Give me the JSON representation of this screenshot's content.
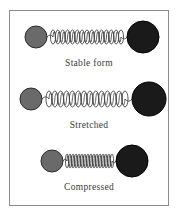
{
  "figure": {
    "background_color": "#ffffff",
    "border_color": "#8c8c8c",
    "caption_color": "#3a3a3a",
    "small_ball_color": "#6a6a6a",
    "small_ball_outline": "#2b2b2b",
    "large_ball_color": "#1a1a1a",
    "large_ball_outline": "#000000",
    "spring_color": "#4a4a4a"
  },
  "rows": [
    {
      "id": "stable",
      "caption": "Stable form",
      "small_ball": {
        "cx": 26,
        "cy": 20,
        "r": 11
      },
      "large_ball": {
        "cx": 133,
        "cy": 20,
        "r": 16
      },
      "spring": {
        "x_start": 37,
        "x_end": 117,
        "cy": 20,
        "coils": 14,
        "amplitude": 7,
        "lead_in": 6
      }
    },
    {
      "id": "stretched",
      "caption": "Stretched",
      "small_ball": {
        "cx": 21,
        "cy": 20,
        "r": 11
      },
      "large_ball": {
        "cx": 139,
        "cy": 20,
        "r": 17
      },
      "spring": {
        "x_start": 32,
        "x_end": 122,
        "cy": 20,
        "coils": 13,
        "amplitude": 8,
        "lead_in": 7
      }
    },
    {
      "id": "compressed",
      "caption": "Compressed",
      "small_ball": {
        "cx": 42,
        "cy": 20,
        "r": 11
      },
      "large_ball": {
        "cx": 122,
        "cy": 20,
        "r": 16
      },
      "spring": {
        "x_start": 53,
        "x_end": 106,
        "cy": 20,
        "coils": 15,
        "amplitude": 7,
        "lead_in": 4
      }
    }
  ]
}
